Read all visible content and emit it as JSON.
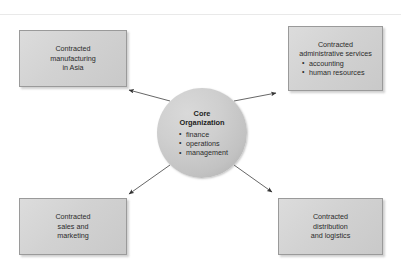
{
  "diagram": {
    "type": "hub-and-spoke-outsourcing-diagram",
    "center": {
      "name": "core-organization",
      "title_line1": "Core",
      "title_line2": "Organization",
      "bullets": [
        "finance",
        "operations",
        "management"
      ]
    },
    "nodes": [
      {
        "id": "manufacturing",
        "position": "top-left",
        "lines": [
          "Contracted",
          "manufacturing",
          "in Asia"
        ],
        "bullets": []
      },
      {
        "id": "admin",
        "position": "top-right",
        "lines": [
          "Contracted",
          "administrative services"
        ],
        "bullets": [
          "accounting",
          "human resources"
        ]
      },
      {
        "id": "sales",
        "position": "bottom-left",
        "lines": [
          "Contracted",
          "sales and",
          "marketing"
        ],
        "bullets": []
      },
      {
        "id": "distribution",
        "position": "bottom-right",
        "lines": [
          "Contracted",
          "distribution",
          "and logistics"
        ],
        "bullets": []
      }
    ],
    "connectors": [
      {
        "id": "arrow-core-to-manufacturing",
        "from": "core-organization",
        "to": "manufacturing",
        "direction": "up-left"
      },
      {
        "id": "arrow-core-to-admin",
        "from": "core-organization",
        "to": "admin",
        "direction": "up-right"
      },
      {
        "id": "arrow-core-to-sales",
        "from": "core-organization",
        "to": "sales",
        "direction": "down-left"
      },
      {
        "id": "arrow-core-to-distribution",
        "from": "core-organization",
        "to": "distribution",
        "direction": "down-right"
      }
    ],
    "colors": {
      "box_fill": "#d4d4d4",
      "box_border": "#9a9a9a",
      "circle_fill": "#c6c6c6",
      "text": "#2b2b2b",
      "arrow": "#444444",
      "background": "#ffffff"
    }
  }
}
